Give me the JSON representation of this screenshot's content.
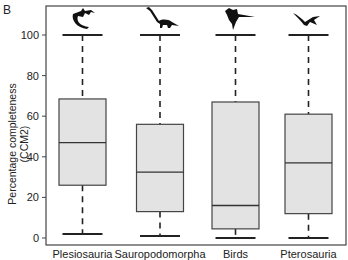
{
  "panel_label": "B",
  "chart_data": {
    "type": "boxplot",
    "title": "",
    "xlabel": "",
    "ylabel": "Percentage completeness (CCM2)",
    "ylim": [
      -1.5,
      116
    ],
    "yticks": [
      0,
      20,
      40,
      60,
      80,
      100
    ],
    "grid": false,
    "legend": null,
    "categories": [
      "Plesiosauria",
      "Sauropodomorpha",
      "Birds",
      "Pterosauria"
    ],
    "icons": [
      "plesiosaur-silhouette-icon",
      "sauropod-silhouette-icon",
      "bird-silhouette-icon",
      "pterosaur-silhouette-icon"
    ],
    "series": [
      {
        "name": "Plesiosauria",
        "min": 2,
        "q1": 26,
        "median": 47,
        "q3": 68.5,
        "max": 100
      },
      {
        "name": "Sauropodomorpha",
        "min": 1,
        "q1": 13,
        "median": 32.5,
        "q3": 56,
        "max": 100
      },
      {
        "name": "Birds",
        "min": 0,
        "q1": 4.5,
        "median": 16,
        "q3": 67,
        "max": 100
      },
      {
        "name": "Pterosauria",
        "min": 0,
        "q1": 12,
        "median": 37,
        "q3": 61,
        "max": 100
      }
    ],
    "box_fill": "#e3e3e3",
    "line_color": "#222222"
  }
}
